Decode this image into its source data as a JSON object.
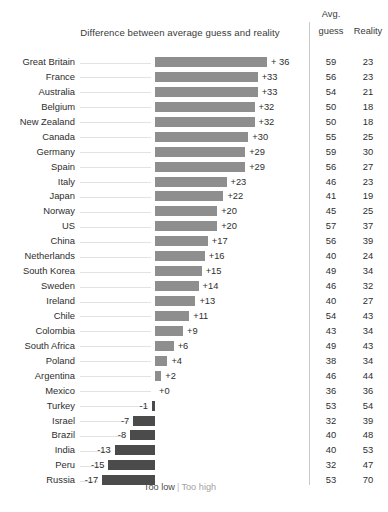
{
  "chart_data": {
    "type": "bar",
    "title": "Difference between average guess and reality",
    "xlabel": "",
    "ylabel": "",
    "orientation": "horizontal",
    "grid": false,
    "zero_baseline": true,
    "legend_position": "bottom-center",
    "legend": [
      {
        "label": "Too low",
        "color": "#4b4b4b"
      },
      {
        "label": "Too high",
        "color": "#8e8e8e"
      }
    ],
    "legend_separator": "|",
    "columns": [
      "Avg. guess",
      "Reality",
      "Difference between average guess and reality"
    ],
    "column_headers": {
      "avg_line1": "Avg.",
      "avg_line2": "guess",
      "reality": "Reality"
    },
    "series": [
      {
        "name": "Difference",
        "values": [
          36,
          33,
          33,
          32,
          32,
          30,
          29,
          29,
          23,
          22,
          20,
          20,
          17,
          16,
          15,
          14,
          13,
          11,
          9,
          6,
          4,
          2,
          0,
          -1,
          -7,
          -8,
          -13,
          -15,
          -17
        ]
      },
      {
        "name": "Avg. guess",
        "values": [
          59,
          56,
          54,
          50,
          50,
          55,
          59,
          56,
          46,
          41,
          45,
          57,
          56,
          40,
          49,
          46,
          40,
          54,
          43,
          49,
          38,
          46,
          36,
          53,
          32,
          40,
          40,
          32,
          53
        ]
      },
      {
        "name": "Reality",
        "values": [
          23,
          23,
          21,
          18,
          18,
          25,
          30,
          27,
          23,
          19,
          25,
          37,
          39,
          24,
          34,
          32,
          27,
          43,
          34,
          43,
          34,
          44,
          36,
          54,
          39,
          48,
          53,
          47,
          70
        ]
      }
    ],
    "categories": [
      "Great Britain",
      "France",
      "Australia",
      "Belgium",
      "New Zealand",
      "Canada",
      "Germany",
      "Spain",
      "Italy",
      "Japan",
      "Norway",
      "US",
      "China",
      "Netherlands",
      "South Korea",
      "Sweden",
      "Ireland",
      "Chile",
      "Colombia",
      "South Africa",
      "Poland",
      "Argentina",
      "Mexico",
      "Turkey",
      "Israel",
      "Brazil",
      "India",
      "Peru",
      "Russia"
    ],
    "xlim": [
      -20,
      40
    ],
    "rows": [
      {
        "country": "Great Britain",
        "diff": 36,
        "diff_label": "+ 36",
        "guess": 59,
        "reality": 23
      },
      {
        "country": "France",
        "diff": 33,
        "diff_label": "+33",
        "guess": 56,
        "reality": 23
      },
      {
        "country": "Australia",
        "diff": 33,
        "diff_label": "+33",
        "guess": 54,
        "reality": 21
      },
      {
        "country": "Belgium",
        "diff": 32,
        "diff_label": "+32",
        "guess": 50,
        "reality": 18
      },
      {
        "country": "New Zealand",
        "diff": 32,
        "diff_label": "+32",
        "guess": 50,
        "reality": 18
      },
      {
        "country": "Canada",
        "diff": 30,
        "diff_label": "+30",
        "guess": 55,
        "reality": 25
      },
      {
        "country": "Germany",
        "diff": 29,
        "diff_label": "+29",
        "guess": 59,
        "reality": 30
      },
      {
        "country": "Spain",
        "diff": 29,
        "diff_label": "+29",
        "guess": 56,
        "reality": 27
      },
      {
        "country": "Italy",
        "diff": 23,
        "diff_label": "+23",
        "guess": 46,
        "reality": 23
      },
      {
        "country": "Japan",
        "diff": 22,
        "diff_label": "+22",
        "guess": 41,
        "reality": 19
      },
      {
        "country": "Norway",
        "diff": 20,
        "diff_label": "+20",
        "guess": 45,
        "reality": 25
      },
      {
        "country": "US",
        "diff": 20,
        "diff_label": "+20",
        "guess": 57,
        "reality": 37
      },
      {
        "country": "China",
        "diff": 17,
        "diff_label": "+17",
        "guess": 56,
        "reality": 39
      },
      {
        "country": "Netherlands",
        "diff": 16,
        "diff_label": "+16",
        "guess": 40,
        "reality": 24
      },
      {
        "country": "South Korea",
        "diff": 15,
        "diff_label": "+15",
        "guess": 49,
        "reality": 34
      },
      {
        "country": "Sweden",
        "diff": 14,
        "diff_label": "+14",
        "guess": 46,
        "reality": 32
      },
      {
        "country": "Ireland",
        "diff": 13,
        "diff_label": "+13",
        "guess": 40,
        "reality": 27
      },
      {
        "country": "Chile",
        "diff": 11,
        "diff_label": "+11",
        "guess": 54,
        "reality": 43
      },
      {
        "country": "Colombia",
        "diff": 9,
        "diff_label": "+9",
        "guess": 43,
        "reality": 34
      },
      {
        "country": "South Africa",
        "diff": 6,
        "diff_label": "+6",
        "guess": 49,
        "reality": 43
      },
      {
        "country": "Poland",
        "diff": 4,
        "diff_label": "+4",
        "guess": 38,
        "reality": 34
      },
      {
        "country": "Argentina",
        "diff": 2,
        "diff_label": "+2",
        "guess": 46,
        "reality": 44
      },
      {
        "country": "Mexico",
        "diff": 0,
        "diff_label": "+0",
        "guess": 36,
        "reality": 36
      },
      {
        "country": "Turkey",
        "diff": -1,
        "diff_label": "-1",
        "guess": 53,
        "reality": 54
      },
      {
        "country": "Israel",
        "diff": -7,
        "diff_label": "-7",
        "guess": 32,
        "reality": 39
      },
      {
        "country": "Brazil",
        "diff": -8,
        "diff_label": "-8",
        "guess": 40,
        "reality": 48
      },
      {
        "country": "India",
        "diff": -13,
        "diff_label": "-13",
        "guess": 40,
        "reality": 53
      },
      {
        "country": "Peru",
        "diff": -15,
        "diff_label": "-15",
        "guess": 32,
        "reality": 47
      },
      {
        "country": "Russia",
        "diff": -17,
        "diff_label": "-17",
        "guess": 53,
        "reality": 70
      }
    ]
  },
  "colors": {
    "bar_positive": "#8e8e8e",
    "bar_negative": "#4b4b4b",
    "leader_line": "#e2e2e2",
    "divider": "#c9c9c9",
    "text": "#2e2e2e"
  }
}
